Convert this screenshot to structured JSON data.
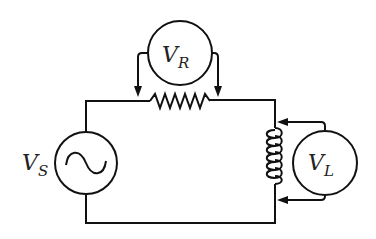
{
  "diagram": {
    "type": "circuit",
    "source": {
      "label": "V",
      "subscript": "S",
      "symbol": "ac-sine"
    },
    "resistor_meter": {
      "label": "V",
      "subscript": "R"
    },
    "inductor_meter": {
      "label": "V",
      "subscript": "L"
    },
    "components": [
      "ac-voltage-source",
      "resistor",
      "inductor",
      "voltmeter-VR",
      "voltmeter-VL"
    ]
  }
}
